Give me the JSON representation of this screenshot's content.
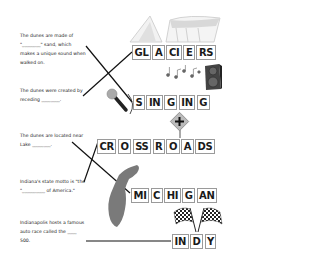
{
  "clues": [
    {
      "id": "singing-sand",
      "lines": [
        "The dunes are made of",
        "\"________\" sand, which",
        "makes a unique sound when",
        "walked on."
      ]
    },
    {
      "id": "glaciers",
      "lines": [
        "The dunes were created by",
        "receding ________."
      ]
    },
    {
      "id": "lake-michigan",
      "lines": [
        "The dunes are located near",
        "Lake ________."
      ]
    },
    {
      "id": "crossroads",
      "lines": [
        "Indiana's state motto is \"the",
        "\"__________ of America.\""
      ]
    },
    {
      "id": "indy",
      "lines": [
        "Indianapolis hosts a famous",
        "auto race called the ____",
        "500."
      ]
    }
  ],
  "answers": [
    {
      "word": "GLACIERS",
      "tiles": [
        "GL",
        "A",
        "CI",
        "E",
        "RS"
      ]
    },
    {
      "word": "SINGING",
      "tiles": [
        "S",
        "IN",
        "G",
        "IN",
        "G"
      ]
    },
    {
      "word": "CROSSROADS",
      "tiles": [
        "CR",
        "O",
        "SS",
        "R",
        "O",
        "A",
        "DS"
      ]
    },
    {
      "word": "MICHIGAN",
      "tiles": [
        "MI",
        "C",
        "HI",
        "G",
        "AN"
      ]
    },
    {
      "word": "INDY",
      "tiles": [
        "IN",
        "D",
        "Y"
      ]
    }
  ],
  "icons": [
    "glacier-icon",
    "music-notes-icon",
    "speaker-icon",
    "microphone-icon",
    "crossroads-sign-icon",
    "lake-michigan-icon",
    "checkered-flags-icon"
  ],
  "colors": {
    "line": "#111111",
    "tile_border": "#9a9a9a",
    "icon_gray": "#777777"
  }
}
